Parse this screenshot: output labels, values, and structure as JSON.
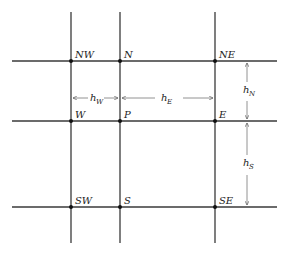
{
  "diagram": {
    "nodes": [
      {
        "id": "NW",
        "label": "NW"
      },
      {
        "id": "N",
        "label": "N"
      },
      {
        "id": "NE",
        "label": "NE"
      },
      {
        "id": "W",
        "label": "W"
      },
      {
        "id": "P",
        "label": "P"
      },
      {
        "id": "E",
        "label": "E"
      },
      {
        "id": "SW",
        "label": "SW"
      },
      {
        "id": "S",
        "label": "S"
      },
      {
        "id": "SE",
        "label": "SE"
      }
    ],
    "spacings": {
      "hW": {
        "base": "h",
        "sub": "W"
      },
      "hE": {
        "base": "h",
        "sub": "E"
      },
      "hN": {
        "base": "h",
        "sub": "N"
      },
      "hS": {
        "base": "h",
        "sub": "S"
      }
    },
    "colors": {
      "line": "#3a3a3a",
      "dimension": "#777777",
      "background": "#ffffff"
    }
  }
}
